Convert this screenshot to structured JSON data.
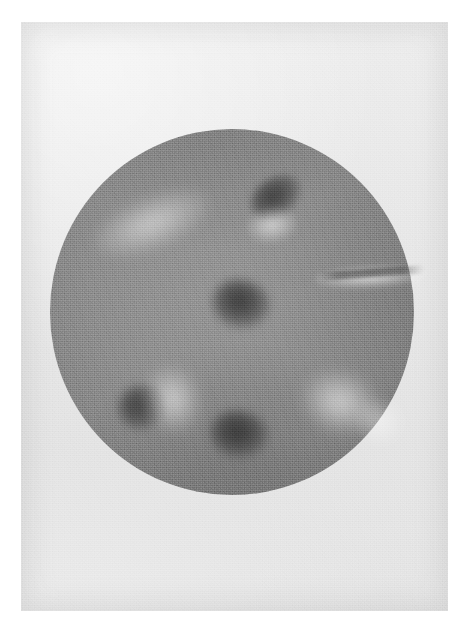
{
  "image": {
    "kind": "astronomical-photograph",
    "subject": "solar-disk",
    "rendering": "grayscale-film-print",
    "caption": "",
    "plate": {
      "width_px": 465,
      "height_px": 633,
      "paper_color": "#ffffff",
      "margin_px": 21
    },
    "print_area": {
      "x_px": 21,
      "y_px": 22,
      "width_px": 427,
      "height_px": 589,
      "sky_background_color": "#e9e9e9",
      "grain": "heavy"
    },
    "disk": {
      "center_x_px": 232,
      "center_y_px": 311,
      "radius_x_px": 182,
      "radius_y_px": 183,
      "mean_color": "#8a8a8a",
      "center_color": "#949494",
      "limb_color": "#767676",
      "limb_darkening": "present",
      "edge_softness_px": 8
    }
  },
  "chart_data": {
    "type": "heatmap",
    "title": "",
    "xlabel": "",
    "ylabel": "",
    "colorscale": "grayscale",
    "value_range": [
      0,
      255
    ],
    "background_value": 233,
    "disk_center_value": 148,
    "disk_limb_value": 118,
    "features": [
      {
        "id": "plage-nw",
        "label": "Northwest plage band",
        "class": "plage",
        "cx_px": 152,
        "cy_px": 222,
        "w_px": 120,
        "h_px": 52,
        "rotation_deg": -22,
        "peak_value": 186,
        "intensity": 0.62
      },
      {
        "id": "spot-ne",
        "label": "Northeast sunspot group",
        "class": "sunspot",
        "cx_px": 276,
        "cy_px": 196,
        "w_px": 54,
        "h_px": 38,
        "rotation_deg": -34,
        "peak_value": 96,
        "intensity": 0.72
      },
      {
        "id": "plage-ne",
        "label": "Northeast plage",
        "class": "plage",
        "cx_px": 272,
        "cy_px": 224,
        "w_px": 50,
        "h_px": 34,
        "rotation_deg": -10,
        "peak_value": 196,
        "intensity": 0.7
      },
      {
        "id": "plage-e-filament",
        "label": "East limb elongated plage streak",
        "class": "plage",
        "cx_px": 370,
        "cy_px": 276,
        "w_px": 112,
        "h_px": 22,
        "rotation_deg": -3,
        "peak_value": 205,
        "intensity": 0.8
      },
      {
        "id": "filament-e",
        "label": "Dark filament across east plage",
        "class": "filament",
        "cx_px": 372,
        "cy_px": 272,
        "w_px": 104,
        "h_px": 8,
        "rotation_deg": -4,
        "peak_value": 104,
        "intensity": 0.55
      },
      {
        "id": "spot-center",
        "label": "Central sunspot group",
        "class": "sunspot",
        "cx_px": 241,
        "cy_px": 303,
        "w_px": 58,
        "h_px": 48,
        "rotation_deg": 12,
        "peak_value": 92,
        "intensity": 0.8
      },
      {
        "id": "spot-sw",
        "label": "Southwest sunspot group",
        "class": "sunspot",
        "cx_px": 142,
        "cy_px": 406,
        "w_px": 48,
        "h_px": 44,
        "rotation_deg": -18,
        "peak_value": 98,
        "intensity": 0.7
      },
      {
        "id": "plage-sw",
        "label": "Southwest plage",
        "class": "plage",
        "cx_px": 172,
        "cy_px": 398,
        "w_px": 56,
        "h_px": 66,
        "rotation_deg": -14,
        "peak_value": 198,
        "intensity": 0.72
      },
      {
        "id": "spot-s",
        "label": "South sunspot group",
        "class": "sunspot",
        "cx_px": 239,
        "cy_px": 433,
        "w_px": 58,
        "h_px": 46,
        "rotation_deg": 8,
        "peak_value": 96,
        "intensity": 0.76
      },
      {
        "id": "plage-se",
        "label": "Southeast plage",
        "class": "plage",
        "cx_px": 340,
        "cy_px": 401,
        "w_px": 76,
        "h_px": 60,
        "rotation_deg": 16,
        "peak_value": 200,
        "intensity": 0.74
      },
      {
        "id": "plage-se-limb",
        "label": "Southeast limb brightening",
        "class": "plage",
        "cx_px": 378,
        "cy_px": 420,
        "w_px": 48,
        "h_px": 44,
        "rotation_deg": 30,
        "peak_value": 190,
        "intensity": 0.5
      }
    ]
  }
}
